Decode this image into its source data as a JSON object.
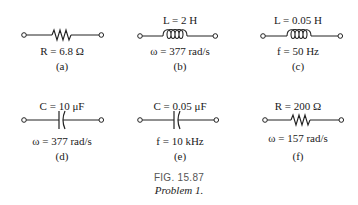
{
  "figure": {
    "number": "FIG. 15.87",
    "caption": "Problem 1."
  },
  "panels": [
    {
      "id": "a",
      "element": "resistor",
      "top_label": "",
      "bottom_label": "R = 6.8 Ω",
      "tag": "(a)"
    },
    {
      "id": "b",
      "element": "inductor",
      "top_label": "L = 2 H",
      "bottom_label": "ω = 377 rad/s",
      "tag": "(b)"
    },
    {
      "id": "c",
      "element": "inductor",
      "top_label": "L = 0.05 H",
      "bottom_label": "f = 50 Hz",
      "tag": "(c)"
    },
    {
      "id": "d",
      "element": "capacitor",
      "top_label": "C = 10 μF",
      "bottom_label": "ω = 377 rad/s",
      "tag": "(d)"
    },
    {
      "id": "e",
      "element": "capacitor",
      "top_label": "C = 0.05 μF",
      "bottom_label": "f = 10 kHz",
      "tag": "(e)"
    },
    {
      "id": "f",
      "element": "resistor",
      "top_label": "R = 200 Ω",
      "bottom_label": "ω = 157 rad/s",
      "tag": "(f)"
    }
  ]
}
